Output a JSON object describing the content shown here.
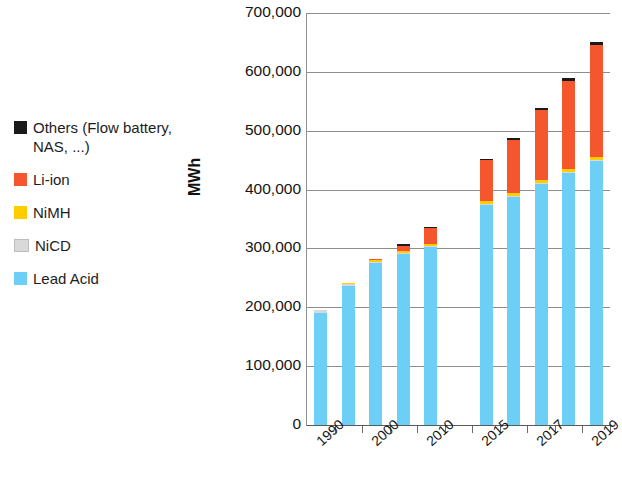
{
  "chart_data": {
    "type": "bar",
    "subtype": "stacked",
    "title": "",
    "xlabel": "",
    "ylabel": "MWh",
    "ylim": [
      0,
      700000
    ],
    "ytick_step": 100000,
    "ytick_labels": [
      "700,000",
      "600,000",
      "500,000",
      "400,000",
      "300,000",
      "200,000",
      "100,000",
      "0"
    ],
    "ytick_values": [
      700000,
      600000,
      500000,
      400000,
      300000,
      200000,
      100000,
      0
    ],
    "grid": "horizontal",
    "legend_position": "left-outside",
    "categories": [
      "1990",
      "1995",
      "2000",
      "2005",
      "2010",
      "",
      "2015",
      "2016",
      "2017",
      "2018",
      "2019"
    ],
    "xtick_labels_shown": [
      "1990",
      "",
      "2000",
      "",
      "2010",
      "",
      "2015",
      "",
      "2017",
      "",
      "2019"
    ],
    "empty_category_index": 5,
    "series": [
      {
        "name": "Lead Acid",
        "color": "#6ecff6",
        "values": [
          191000,
          236000,
          275000,
          291000,
          302000,
          null,
          374000,
          387000,
          410000,
          428000,
          448000
        ]
      },
      {
        "name": "NiCD",
        "color": "#d9d9d9",
        "values": [
          4000,
          3000,
          2000,
          2000,
          2000,
          null,
          2000,
          2000,
          2000,
          2000,
          2000
        ]
      },
      {
        "name": "NiMH",
        "color": "#ffcc00",
        "values": [
          0,
          2000,
          3000,
          3000,
          4000,
          null,
          5000,
          5000,
          5000,
          5000,
          5000
        ]
      },
      {
        "name": "Li-ion",
        "color": "#f4562e",
        "values": [
          0,
          0,
          2000,
          9000,
          26000,
          null,
          69000,
          91000,
          119000,
          150000,
          191000
        ]
      },
      {
        "name": "Others (Flow battery, NAS, ...)",
        "color": "#1a1a1a",
        "values": [
          0,
          0,
          0,
          1000,
          3000,
          null,
          2000,
          3000,
          3000,
          4000,
          4000
        ]
      }
    ],
    "totals": [
      195000,
      241000,
      282000,
      306000,
      337000,
      null,
      452000,
      488000,
      539000,
      589000,
      650000
    ]
  },
  "legend": {
    "items": [
      {
        "label": "Others (Flow battery,\nNAS, ...)",
        "color": "#1a1a1a",
        "name": "others"
      },
      {
        "label": "Li-ion",
        "color": "#f4562e",
        "name": "li-ion"
      },
      {
        "label": "NiMH",
        "color": "#ffcc00",
        "name": "nimh"
      },
      {
        "label": "NiCD",
        "color": "#d9d9d9",
        "name": "nicd"
      },
      {
        "label": "Lead Acid",
        "color": "#6ecff6",
        "name": "lead-acid"
      }
    ]
  },
  "axis": {
    "y_title": "MWh"
  }
}
